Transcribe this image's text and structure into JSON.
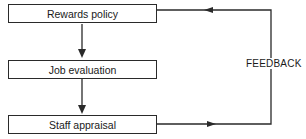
{
  "diagram": {
    "boxes": [
      {
        "label": "Rewards policy"
      },
      {
        "label": "Job evaluation"
      },
      {
        "label": "Staff appraisal"
      }
    ],
    "feedback_label": "FEEDBACK",
    "line_color": "#2a2a2a"
  }
}
